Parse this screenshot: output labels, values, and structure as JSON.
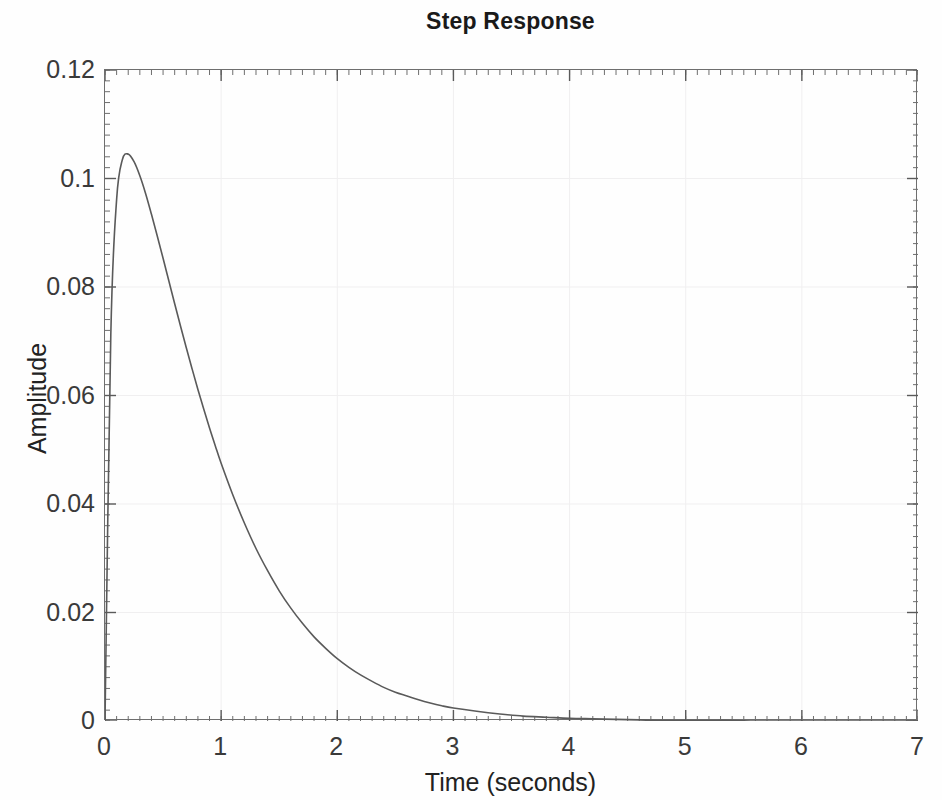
{
  "chart_data": {
    "type": "line",
    "title": "Step Response",
    "xlabel": "Time (seconds)",
    "ylabel": "Amplitude",
    "xlim": [
      0,
      7
    ],
    "ylim": [
      0,
      0.12
    ],
    "xticks": [
      0,
      1,
      2,
      3,
      4,
      5,
      6,
      7
    ],
    "xtick_labels": [
      "0",
      "1",
      "2",
      "3",
      "4",
      "5",
      "6",
      "7"
    ],
    "yticks": [
      0,
      0.02,
      0.04,
      0.06,
      0.08,
      0.1,
      0.12
    ],
    "ytick_labels": [
      "0",
      "0.02",
      "0.04",
      "0.06",
      "0.08",
      "0.1",
      "0.12"
    ],
    "grid": true,
    "grid_color": "#f0eff0",
    "legend": null,
    "line_color": "#5a5a5a",
    "line_width": 1.6,
    "minor_ticks": true,
    "minor_tick_count_x": 10,
    "minor_tick_count_y": 10,
    "annotations": [],
    "series": [
      {
        "name": "step response",
        "x": [
          0.0,
          0.05,
          0.1,
          0.15,
          0.2,
          0.25,
          0.3,
          0.35,
          0.4,
          0.45,
          0.5,
          0.55,
          0.6,
          0.65,
          0.7,
          0.75,
          0.8,
          0.85,
          0.9,
          0.95,
          1.0,
          1.1,
          1.2,
          1.3,
          1.4,
          1.5,
          1.6,
          1.7,
          1.8,
          1.9,
          2.0,
          2.1,
          2.2,
          2.3,
          2.4,
          2.5,
          2.6,
          2.7,
          2.8,
          2.9,
          3.0,
          3.2,
          3.4,
          3.6,
          3.8,
          4.0,
          4.2,
          4.4,
          4.6,
          4.8,
          5.0,
          5.2,
          5.4,
          5.6,
          5.8,
          6.0,
          6.2,
          6.4,
          6.6,
          6.8,
          7.0
        ],
        "y": [
          0.0,
          0.0712,
          0.0961,
          0.1035,
          0.1045,
          0.1031,
          0.1005,
          0.0972,
          0.0934,
          0.0894,
          0.0853,
          0.0811,
          0.0769,
          0.0728,
          0.0688,
          0.0649,
          0.0611,
          0.0575,
          0.054,
          0.0507,
          0.0475,
          0.0417,
          0.0365,
          0.0318,
          0.0277,
          0.024,
          0.0208,
          0.018,
          0.0155,
          0.0134,
          0.0115,
          0.0099,
          0.0085,
          0.0073,
          0.0062,
          0.0053,
          0.0046,
          0.0039,
          0.0033,
          0.0028,
          0.0024,
          0.0018,
          0.0013,
          0.0009,
          0.0007,
          0.0005,
          0.0004,
          0.0003,
          0.0002,
          0.0001,
          0.0001,
          0.0001,
          0.0001,
          0.0,
          0.0,
          0.0,
          0.0,
          0.0,
          0.0,
          0.0,
          0.0
        ],
        "peak_x": 0.2,
        "peak_y": 0.1045,
        "final_value": 0.0
      }
    ]
  }
}
